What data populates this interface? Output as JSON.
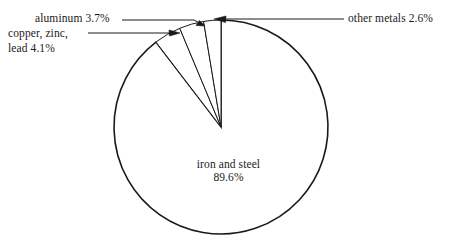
{
  "chart_data": {
    "type": "pie",
    "title": "",
    "subtitle": "",
    "xlabel": "",
    "ylabel": "",
    "grid": false,
    "legend_position": "none",
    "units": "percent",
    "total": 100.0,
    "categories": [
      "iron and steel",
      "copper, zinc, lead",
      "aluminum",
      "other metals"
    ],
    "values": [
      89.6,
      4.1,
      3.7,
      2.6
    ],
    "slices": [
      {
        "name": "iron and steel",
        "value": 89.6,
        "value_text": "89.6%",
        "label_lines": [
          "iron and steel",
          "89.6%"
        ],
        "label_placement": "inside-center",
        "leader_line": false,
        "fill": "#ffffff",
        "stroke": "#1a1a1a"
      },
      {
        "name": "copper, zinc, lead",
        "value": 4.1,
        "value_text": "4.1%",
        "label_lines": [
          "copper, zinc,",
          "lead  4.1%"
        ],
        "label_placement": "outside-left",
        "leader_line": true,
        "fill": "#ffffff",
        "stroke": "#1a1a1a"
      },
      {
        "name": "aluminum",
        "value": 3.7,
        "value_text": "3.7%",
        "label_lines": [
          "aluminum  3.7%"
        ],
        "label_placement": "outside-upper-left",
        "leader_line": true,
        "fill": "#ffffff",
        "stroke": "#1a1a1a"
      },
      {
        "name": "other metals",
        "value": 2.6,
        "value_text": "2.6%",
        "label_lines": [
          "other metals 2.6%"
        ],
        "label_placement": "outside-right",
        "leader_line": true,
        "fill": "#ffffff",
        "stroke": "#1a1a1a"
      }
    ],
    "colors": {
      "outline": "#1a1a1a",
      "fill": "#ffffff",
      "text": "#1a1a1a",
      "leader": "#1a1a1a"
    },
    "geometry": {
      "center_x": 221,
      "center_y": 127,
      "radius": 107,
      "start_angle_deg": -90,
      "direction": "clockwise"
    }
  },
  "labels": {
    "aluminum": "aluminum  3.7%",
    "copper_line1": "copper, zinc,",
    "copper_line2": "lead  4.1%",
    "other_metals": "other metals 2.6%",
    "iron_line1": "iron and steel",
    "iron_line2": "89.6%"
  }
}
